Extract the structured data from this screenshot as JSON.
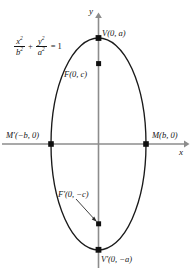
{
  "figure": {
    "colors": {
      "curve": "#1a1a1a",
      "axis": "#8c8c8c",
      "point": "#101010",
      "text": "#141414",
      "background": "#ffffff"
    },
    "axes": {
      "x_label": "x",
      "y_label": "y"
    },
    "equation": {
      "numerator_1": "x",
      "numerator_1_exp": "2",
      "denominator_1": "b",
      "denominator_1_exp": "2",
      "operator": "+",
      "numerator_2": "y",
      "numerator_2_exp": "2",
      "denominator_2": "a",
      "denominator_2_exp": "2",
      "equals": "=",
      "right_side": "1"
    },
    "labels": {
      "vertex_top": "V(0, a)",
      "focus_top": "F(0, c)",
      "vertex_left": "Mʹ(−b, 0)",
      "vertex_right": "M(b, 0)",
      "focus_bottom": "Fʹ(0, −c)",
      "vertex_bottom": "Vʹ(0, −a)"
    },
    "geometry": {
      "center_x": 98.5,
      "center_y": 144,
      "semi_minor_b": 47.5,
      "semi_major_a": 106,
      "focus_offset_c": 80,
      "points": [
        {
          "name": "vertex-top",
          "x": 98.5,
          "y": 38
        },
        {
          "name": "focus-top",
          "x": 98.5,
          "y": 64
        },
        {
          "name": "vertex-left",
          "x": 51,
          "y": 144
        },
        {
          "name": "vertex-right",
          "x": 146,
          "y": 144
        },
        {
          "name": "focus-bottom",
          "x": 98.5,
          "y": 224
        },
        {
          "name": "vertex-bottom",
          "x": 98.5,
          "y": 250
        }
      ]
    }
  }
}
